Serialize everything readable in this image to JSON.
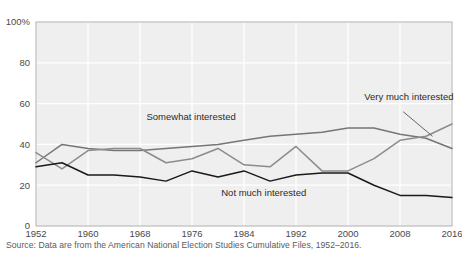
{
  "chart_data": {
    "type": "line",
    "title": "",
    "subtitle": "",
    "xlabel": "",
    "ylabel": "",
    "x": [
      1952,
      1956,
      1960,
      1964,
      1968,
      1972,
      1976,
      1980,
      1984,
      1988,
      1992,
      1996,
      2000,
      2004,
      2008,
      2012,
      2016
    ],
    "xlim": [
      1952,
      2016
    ],
    "ylim": [
      0,
      100
    ],
    "xticks": [
      1952,
      1960,
      1968,
      1976,
      1984,
      1992,
      2000,
      2008,
      2016
    ],
    "xtick_labels": [
      "1952",
      "1960",
      "1968",
      "1976",
      "1984",
      "1992",
      "2000",
      "2008",
      "2016"
    ],
    "yticks": [
      0,
      20,
      40,
      60,
      80,
      100
    ],
    "ytick_labels": [
      "0",
      "20",
      "40",
      "60",
      "80",
      "100%"
    ],
    "grid": true,
    "legend_position": "inline-annotations",
    "series": [
      {
        "name": "Somewhat interested",
        "color": "#767676",
        "values": [
          31,
          40,
          38,
          37,
          37,
          38,
          39,
          40,
          42,
          44,
          45,
          46,
          48,
          48,
          45,
          43,
          38
        ]
      },
      {
        "name": "Very much interested",
        "color": "#8c8c8c",
        "values": [
          36,
          28,
          37,
          38,
          38,
          31,
          33,
          38,
          30,
          29,
          39,
          27,
          27,
          33,
          42,
          44,
          50
        ]
      },
      {
        "name": "Not much interested",
        "color": "#1a1a1a",
        "values": [
          29,
          31,
          25,
          25,
          24,
          22,
          27,
          24,
          27,
          22,
          25,
          26,
          26,
          20,
          15,
          15,
          14
        ]
      }
    ],
    "annotations": [
      {
        "text": "Somewhat interested",
        "x": 1969,
        "y": 52,
        "anchor": "start"
      },
      {
        "text": "Very much interested",
        "x": 2002.5,
        "y": 62,
        "anchor": "start"
      },
      {
        "text": "Not much interested",
        "x": 1980.5,
        "y": 14.5,
        "anchor": "start"
      }
    ],
    "source": "Source: Data are from the American National Election Studies Cumulative Files, 1952–2016.",
    "panel_background": "#efefef",
    "gridline_color": "#ffffff",
    "axis_border_color": "#b0b0b0"
  }
}
